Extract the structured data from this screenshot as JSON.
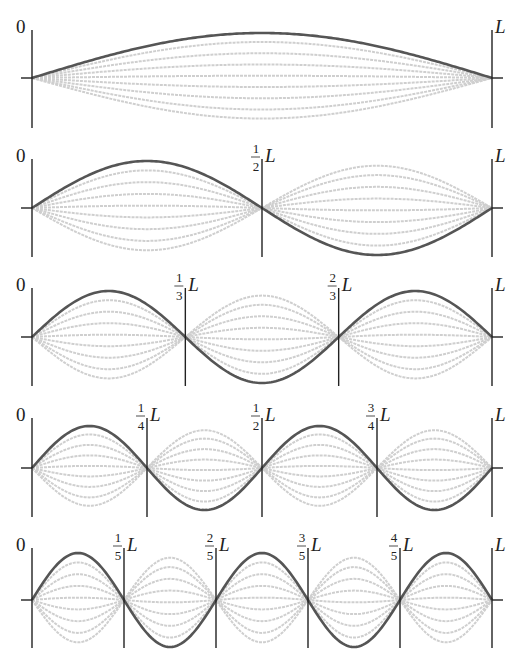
{
  "title": "Standing wave modes on a string fixed at both ends",
  "colors": {
    "main_curve": "#555555",
    "ghost_curve": "#cfcfcf",
    "axis": "#222222",
    "text": "#222222"
  },
  "labels": {
    "origin": "0",
    "end": "L",
    "L": "L"
  },
  "geometry": {
    "x_left": 32,
    "x_right": 492
  },
  "panels": [
    {
      "mode": 1,
      "center_y": 78,
      "amplitude": 45,
      "line_top": 30,
      "line_bottom": 128,
      "nodes": []
    },
    {
      "mode": 2,
      "center_y": 208,
      "amplitude": 47,
      "line_top": 159,
      "line_bottom": 257,
      "nodes": [
        {
          "num": "1",
          "den": "2"
        }
      ]
    },
    {
      "mode": 3,
      "center_y": 337,
      "amplitude": 46,
      "line_top": 288,
      "line_bottom": 386,
      "nodes": [
        {
          "num": "1",
          "den": "3"
        },
        {
          "num": "2",
          "den": "3"
        }
      ]
    },
    {
      "mode": 4,
      "center_y": 468,
      "amplitude": 42,
      "line_top": 418,
      "line_bottom": 517,
      "nodes": [
        {
          "num": "1",
          "den": "4"
        },
        {
          "num": "1",
          "den": "2"
        },
        {
          "num": "3",
          "den": "4"
        }
      ]
    },
    {
      "mode": 5,
      "center_y": 600,
      "amplitude": 47,
      "line_top": 548,
      "line_bottom": 648,
      "nodes": [
        {
          "num": "1",
          "den": "5"
        },
        {
          "num": "2",
          "den": "5"
        },
        {
          "num": "3",
          "den": "5"
        },
        {
          "num": "4",
          "den": "5"
        }
      ]
    }
  ],
  "ghost_fractions": [
    0.8,
    0.55,
    0.3,
    0.05,
    -0.2,
    -0.45,
    -0.7,
    -0.9
  ]
}
